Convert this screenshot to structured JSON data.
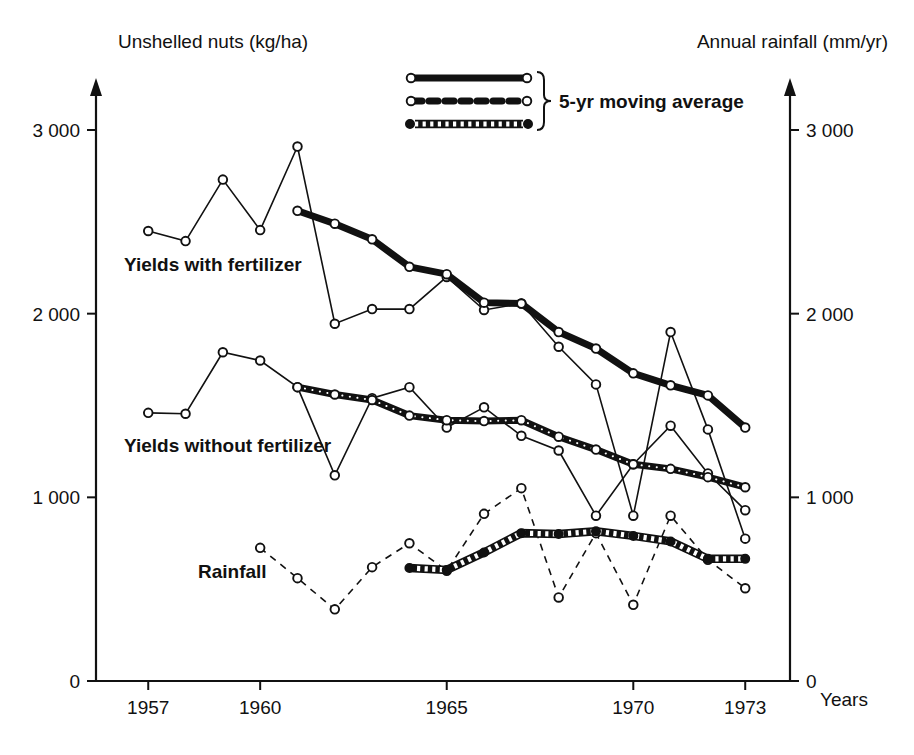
{
  "chart_data": {
    "type": "line",
    "title": "",
    "ylabel_left": "Unshelled nuts (kg/ha)",
    "ylabel_right": "Annual rainfall (mm/yr)",
    "xlabel": "Years",
    "xlim": [
      1955.6,
      1974.2
    ],
    "ylim": [
      0,
      3250
    ],
    "grid": false,
    "y_ticks_left": [
      "0",
      "1 000",
      "2 000",
      "3 000"
    ],
    "y_ticks_left_values": [
      0,
      1000,
      2000,
      3000
    ],
    "y_ticks_right": [
      "0",
      "1 000",
      "2 000",
      "3 000"
    ],
    "y_ticks_right_values": [
      0,
      1000,
      2000,
      3000
    ],
    "x_ticks": [
      "1957",
      "1960",
      "1965",
      "1970",
      "1973"
    ],
    "x_tick_values": [
      1957,
      1960,
      1965,
      1970,
      1973
    ],
    "legend": {
      "brace_label": "5-yr moving average",
      "entries": [
        {
          "name": "solid-thick-open-marker",
          "style": "thick solid line, open circle markers"
        },
        {
          "name": "dashed-open-marker",
          "style": "thick dashed line, open circle markers"
        },
        {
          "name": "hatched-band-filled-marker",
          "style": "hatched band, filled circle markers"
        }
      ]
    },
    "series": [
      {
        "name": "Yields with fertilizer",
        "label": "Yields with fertilizer",
        "axis": "left",
        "style": "thin-solid-open",
        "x": [
          1957,
          1958,
          1959,
          1960,
          1961,
          1962,
          1963,
          1964,
          1965,
          1966,
          1967,
          1968,
          1969,
          1970,
          1971,
          1972,
          1973
        ],
        "values": [
          2450,
          2395,
          2730,
          2455,
          2910,
          1945,
          2025,
          2025,
          2200,
          2020,
          2055,
          1820,
          1615,
          900,
          1900,
          1370,
          775
        ]
      },
      {
        "name": "Yields with fertilizer - 5yr moving average",
        "label": "",
        "axis": "left",
        "style": "thick-solid-open",
        "x": [
          1961,
          1962,
          1963,
          1964,
          1965,
          1966,
          1967,
          1968,
          1969,
          1970,
          1971,
          1972,
          1973
        ],
        "values": [
          2560,
          2490,
          2405,
          2255,
          2215,
          2060,
          2055,
          1900,
          1810,
          1675,
          1610,
          1555,
          1380
        ]
      },
      {
        "name": "Yields without fertilizer",
        "label": "Yields without fertilizer",
        "axis": "left",
        "style": "thin-solid-open",
        "x": [
          1957,
          1958,
          1959,
          1960,
          1961,
          1962,
          1963,
          1964,
          1965,
          1966,
          1967,
          1968,
          1969,
          1970,
          1971,
          1972,
          1973
        ],
        "values": [
          1460,
          1455,
          1790,
          1745,
          1600,
          1120,
          1540,
          1600,
          1380,
          1490,
          1335,
          1255,
          900,
          1180,
          1390,
          1130,
          930
        ]
      },
      {
        "name": "Yields without fertilizer - 5yr moving average",
        "label": "",
        "axis": "left",
        "style": "thick-dashed-open",
        "x": [
          1961,
          1962,
          1963,
          1964,
          1965,
          1966,
          1967,
          1968,
          1969,
          1970,
          1971,
          1972,
          1973
        ],
        "values": [
          1600,
          1560,
          1530,
          1445,
          1420,
          1415,
          1420,
          1330,
          1260,
          1180,
          1155,
          1110,
          1055
        ]
      },
      {
        "name": "Rainfall",
        "label": "Rainfall",
        "axis": "right",
        "style": "thin-dashed-open",
        "x": [
          1960,
          1961,
          1962,
          1963,
          1964,
          1965,
          1966,
          1967,
          1968,
          1969,
          1970,
          1971,
          1972,
          1973
        ],
        "values": [
          725,
          560,
          390,
          620,
          750,
          600,
          910,
          1050,
          455,
          805,
          415,
          900,
          660,
          505
        ]
      },
      {
        "name": "Rainfall - 5yr moving average",
        "label": "",
        "axis": "right",
        "style": "hatched-band-filled",
        "x": [
          1964,
          1965,
          1966,
          1967,
          1968,
          1969,
          1970,
          1971,
          1972,
          1973
        ],
        "values": [
          615,
          605,
          700,
          805,
          800,
          815,
          790,
          760,
          665,
          665
        ]
      }
    ]
  }
}
